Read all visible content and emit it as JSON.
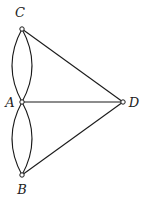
{
  "diagram": {
    "type": "multigraph",
    "nodes": [
      {
        "id": "C",
        "label": "C",
        "x": 22,
        "y": 29,
        "label_x": 20,
        "label_y": 17
      },
      {
        "id": "A",
        "label": "A",
        "x": 22,
        "y": 102,
        "label_x": 10,
        "label_y": 107
      },
      {
        "id": "B",
        "label": "B",
        "x": 22,
        "y": 175,
        "label_x": 22,
        "label_y": 194
      },
      {
        "id": "D",
        "label": "D",
        "x": 123,
        "y": 102,
        "label_x": 134,
        "label_y": 107
      }
    ],
    "edges": [
      {
        "from": "C",
        "to": "A",
        "shape": "curve-left"
      },
      {
        "from": "C",
        "to": "A",
        "shape": "curve-right"
      },
      {
        "from": "A",
        "to": "B",
        "shape": "curve-left"
      },
      {
        "from": "A",
        "to": "B",
        "shape": "curve-right"
      },
      {
        "from": "C",
        "to": "D",
        "shape": "line"
      },
      {
        "from": "A",
        "to": "D",
        "shape": "line"
      },
      {
        "from": "B",
        "to": "D",
        "shape": "line"
      }
    ],
    "colors": {
      "stroke": "#1a1a1a",
      "node_fill": "#ffffff",
      "label": "#222222"
    }
  }
}
